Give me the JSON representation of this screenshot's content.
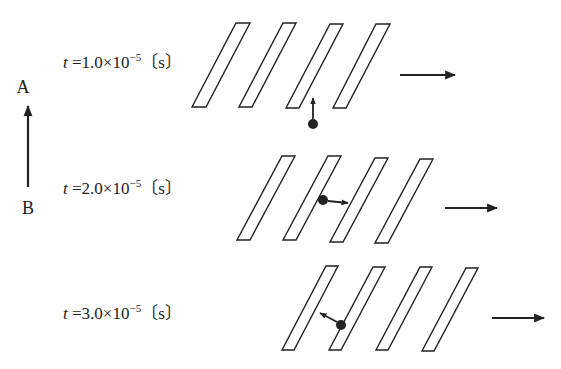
{
  "figure": {
    "direction_axis": {
      "top_label": "A",
      "bottom_label": "B"
    },
    "colors": {
      "ink": "#222222",
      "background": "#ffffff"
    },
    "rows": [
      {
        "time_label": {
          "var": "t",
          "eq": " =1.0×10",
          "exp": "−5",
          "unit": "〔s〕"
        },
        "stripe_count": 4,
        "particle_velocity_direction": "up (toward A)",
        "stripes_velocity_direction": "right"
      },
      {
        "time_label": {
          "var": "t",
          "eq": " =2.0×10",
          "exp": "−5",
          "unit": "〔s〕"
        },
        "stripe_count": 4,
        "particle_velocity_direction": "right",
        "stripes_velocity_direction": "right"
      },
      {
        "time_label": {
          "var": "t",
          "eq": " =3.0×10",
          "exp": "−5",
          "unit": "〔s〕"
        },
        "stripe_count": 4,
        "particle_velocity_direction": "up-left",
        "stripes_velocity_direction": "right"
      }
    ]
  }
}
